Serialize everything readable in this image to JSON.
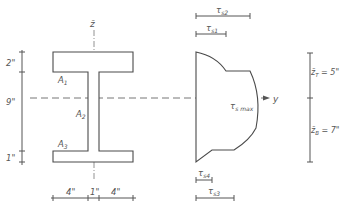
{
  "figure": {
    "cross_section": {
      "axis_label": "z̄",
      "area_labels": [
        "A1",
        "A2",
        "A3"
      ],
      "vertical_dimensions": [
        "2\"",
        "9\"",
        "1\""
      ],
      "horizontal_dimensions": [
        "4\"",
        "1\"",
        "4\""
      ]
    },
    "neutral_axis_label": "y",
    "shear_distribution": {
      "max_label": "τs max",
      "top_labels": [
        "τs2",
        "τs1"
      ],
      "bottom_labels": [
        "τs4",
        "τs3"
      ]
    },
    "centroid_distances": {
      "top": "z̄T = 5\"",
      "bottom": "z̄B = 7\""
    }
  },
  "labels": {
    "z_axis": "z̄",
    "A1": "A",
    "A1_sub": "1",
    "A2": "A",
    "A2_sub": "2",
    "A3": "A",
    "A3_sub": "3",
    "dim_2": "2\"",
    "dim_9": "9\"",
    "dim_1v": "1\"",
    "dim_4l": "4\"",
    "dim_1h": "1\"",
    "dim_4r": "4\"",
    "y_axis": "y",
    "tau": "τ",
    "ts2_sub": "s2",
    "ts1_sub": "s1",
    "tsmax_sub": "s max",
    "ts4_sub": "s4",
    "ts3_sub": "s3",
    "zT": "z̄",
    "zT_sub": "T",
    "zT_val": " = 5\"",
    "zB": "z̄",
    "zB_sub": "B",
    "zB_val": " = 7\""
  }
}
